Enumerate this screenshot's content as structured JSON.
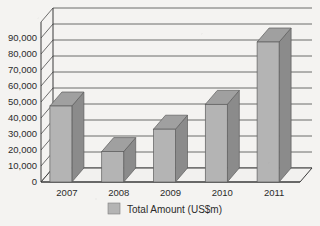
{
  "chart_data": {
    "type": "bar",
    "title": "",
    "subtitle": "",
    "xlabel": "",
    "ylabel": "",
    "categories": [
      "2007",
      "2008",
      "2009",
      "2010",
      "2011"
    ],
    "values": [
      47500,
      19000,
      33000,
      48500,
      87500
    ],
    "series": [
      {
        "name": "Total Amount (US$m)",
        "values": [
          47500,
          19000,
          33000,
          48500,
          87500
        ]
      }
    ],
    "ylim": [
      0,
      90000
    ],
    "ytick_labels": [
      "0",
      "10,000",
      "20,000",
      "30,000",
      "40,000",
      "50,000",
      "60,000",
      "70,000",
      "80,000",
      "90,000"
    ],
    "ytick_values": [
      0,
      10000,
      20000,
      30000,
      40000,
      50000,
      60000,
      70000,
      80000,
      90000
    ],
    "grid": true,
    "legend": {
      "position": "bottom",
      "entries": [
        {
          "label": "Total Amount (US$m)",
          "color": "#b4b4b4"
        }
      ]
    },
    "style": {
      "three_d": true,
      "bar_face_color": "#b4b4b4",
      "bar_side_color": "#8b8b8b",
      "bar_top_color": "#a0a0a0",
      "background_color": "#f4f3f1",
      "axis_color": "#3a3a3a",
      "grid_color": "#4a4a4a",
      "text_color": "#2b2b2b"
    }
  }
}
